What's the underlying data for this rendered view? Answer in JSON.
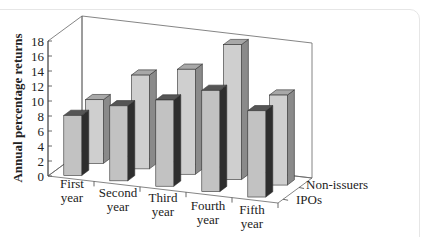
{
  "chart_data": {
    "type": "bar",
    "style": "3d-grouped-depth",
    "title": "",
    "xlabel": "",
    "ylabel": "Annual percentage returns",
    "ylim": [
      0,
      18
    ],
    "yticks": [
      0,
      2,
      4,
      6,
      8,
      10,
      12,
      14,
      16,
      18
    ],
    "categories": [
      [
        "First",
        "year"
      ],
      [
        "Second",
        "year"
      ],
      [
        "Third",
        "year"
      ],
      [
        "Fourth",
        "year"
      ],
      [
        "Fifth",
        "year"
      ]
    ],
    "series": [
      {
        "name": "IPOs",
        "values": [
          8,
          10,
          11.5,
          13.5,
          11.5
        ],
        "face": "#c2c2c2",
        "side": "#2e2e2e",
        "top": "#555555"
      },
      {
        "name": "Non-issuers",
        "values": [
          8.5,
          12.5,
          14,
          18,
          12
        ],
        "face": "#cfcfcf",
        "side": "#8a8a8a",
        "top": "#a8a8a8"
      }
    ],
    "grid": false,
    "legend": "depth-axis labels at right"
  }
}
